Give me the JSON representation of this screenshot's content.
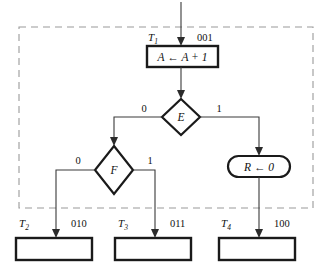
{
  "diagram": {
    "region_label": "dashed-boundary",
    "colors": {
      "shape_stroke": "#1a1a1a",
      "connector": "#3a3a3a",
      "dashed_border": "#9a9a9a",
      "background": "#ffffff"
    },
    "entry": {
      "name": "entry-arrow"
    },
    "operation_box": {
      "register": "A",
      "assign_symbol": "←",
      "expression": "A + 1",
      "full_text": "A ← A + 1"
    },
    "decision_e": {
      "condition": "E",
      "false_label": "0",
      "true_label": "1"
    },
    "decision_f": {
      "condition": "F",
      "false_label": "0",
      "true_label": "1"
    },
    "operation_oval": {
      "register": "R",
      "assign_symbol": "←",
      "expression": "0",
      "full_text": "R ← 0"
    },
    "states": [
      {
        "name": "T",
        "subscript": "1",
        "code": "001",
        "position": "top"
      },
      {
        "name": "T",
        "subscript": "2",
        "code": "010",
        "position": "bottom-left"
      },
      {
        "name": "T",
        "subscript": "3",
        "code": "011",
        "position": "bottom-center"
      },
      {
        "name": "T",
        "subscript": "4",
        "code": "100",
        "position": "bottom-right"
      }
    ]
  }
}
